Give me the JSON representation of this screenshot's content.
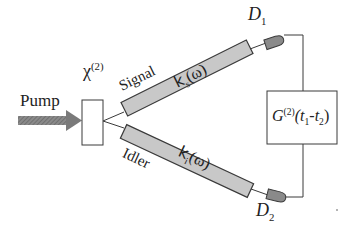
{
  "diagram": {
    "pump_label": "Pump",
    "crystal_label": "χ",
    "crystal_sup": "(2)",
    "signal_label": "Signal",
    "idler_label": "Idler",
    "signal_tube_label_k": "k",
    "signal_tube_label_sub": "s",
    "signal_tube_label_arg": "(ω)",
    "idler_tube_label_k": "k",
    "idler_tube_label_sub": "i",
    "idler_tube_label_arg": "(ω)",
    "detector1_label": "D",
    "detector1_sub": "1",
    "detector2_label": "D",
    "detector2_sub": "2",
    "correlator_G": "G",
    "correlator_sup": "(2)",
    "correlator_t1": "(t",
    "correlator_t1_sub": "1",
    "correlator_dash": "-t",
    "correlator_t2_sub": "2",
    "correlator_close": ")"
  },
  "colors": {
    "tube_fill": "#c8c8c8",
    "stroke": "#3a3a3a",
    "detector_fill": "#8a8a8a",
    "arrow_fill": "#7a7a7a"
  }
}
